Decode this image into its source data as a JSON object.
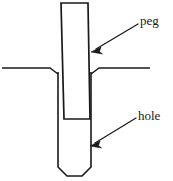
{
  "figure": {
    "kind": "technical-line-drawing",
    "background_color": "#ffffff",
    "line_color": "#1a1a1a"
  },
  "labels": {
    "peg": {
      "text": "peg",
      "icon": "callout-arrow-icon",
      "arrow_direction": "down-left",
      "arrow_from": [
        138,
        24
      ],
      "arrow_to": [
        92,
        52
      ]
    },
    "hole": {
      "text": "hole",
      "icon": "callout-arrow-icon",
      "arrow_direction": "down-left",
      "arrow_from": [
        136,
        118
      ],
      "arrow_to": [
        91,
        146
      ]
    }
  },
  "geometry": {
    "peg": {
      "name": "peg-shape",
      "description": "tall slightly tapered rectangle running from top of image down into the hole",
      "top_left": [
        61,
        3
      ],
      "top_right": [
        88,
        3
      ],
      "bottom_right": [
        90,
        119
      ],
      "bottom_left": [
        64,
        119
      ]
    },
    "hole": {
      "name": "hole-shape",
      "description": "vertical slot with chamfered bottom corners extending below the surface line",
      "left_wall_x": 58,
      "right_wall_x": 91,
      "top_y": 72,
      "bottom_y": 176,
      "chamfer": 9
    },
    "surface_left": {
      "name": "surface-line-left",
      "points": [
        [
          2,
          68
        ],
        [
          50,
          68
        ],
        [
          58,
          74
        ]
      ]
    },
    "surface_right": {
      "name": "surface-line-right",
      "points": [
        [
          91,
          74
        ],
        [
          99,
          68
        ],
        [
          150,
          68
        ]
      ]
    }
  }
}
